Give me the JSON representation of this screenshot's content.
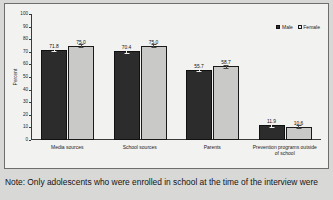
{
  "chart_data": {
    "type": "bar",
    "title": "",
    "xlabel": "",
    "ylabel": "Percent",
    "ylim": [
      0,
      100
    ],
    "yticks": [
      0,
      10,
      20,
      30,
      40,
      50,
      60,
      70,
      80,
      90,
      100
    ],
    "grid": false,
    "legend_position": "top-right",
    "categories": [
      "Media sources",
      "School sources",
      "Parents",
      "Prevention programs outside\nof school"
    ],
    "series": [
      {
        "name": "Male",
        "color": "#2c2c2c",
        "values": [
          71.8,
          70.4,
          55.7,
          11.9
        ],
        "labels": [
          "71.8",
          "70.4",
          "55.7",
          "11.9"
        ]
      },
      {
        "name": "Female",
        "color": "#c9c9c7",
        "values": [
          75.0,
          75.0,
          58.7,
          10.6
        ],
        "labels": [
          "75.0",
          "75.0",
          "58.7",
          "10.6"
        ]
      }
    ],
    "has_error_bars": true
  },
  "legend": {
    "items": [
      {
        "label": "Male"
      },
      {
        "label": "Female"
      }
    ]
  },
  "axis": {
    "y_title": "Percent",
    "tick_labels": [
      "100",
      "90",
      "80",
      "70",
      "60",
      "50",
      "40",
      "30",
      "20",
      "10",
      "0"
    ]
  },
  "footnote": {
    "text": "Note: Only adolescents who were enrolled in school at the time of the interview were"
  }
}
